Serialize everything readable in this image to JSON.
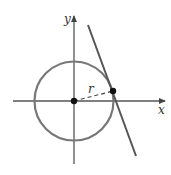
{
  "diagram": {
    "labels": {
      "x_axis": "x",
      "y_axis": "y",
      "radius": "r"
    },
    "colors": {
      "circle": "#777777",
      "axes": "#555555",
      "tangent_line": "#555555",
      "points": "#111111",
      "background": "#ffffff"
    },
    "elements": [
      {
        "type": "axis",
        "name": "x-axis"
      },
      {
        "type": "axis",
        "name": "y-axis"
      },
      {
        "type": "circle",
        "name": "circle",
        "center": "origin"
      },
      {
        "type": "point",
        "name": "center-point"
      },
      {
        "type": "point",
        "name": "tangent-point"
      },
      {
        "type": "dashed-segment",
        "name": "radius",
        "label": "r"
      },
      {
        "type": "line",
        "name": "tangent-line"
      }
    ]
  }
}
